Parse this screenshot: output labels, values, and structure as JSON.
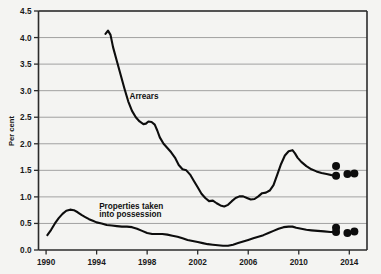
{
  "chart_data": {
    "type": "line",
    "title": "",
    "subtitle": "",
    "xlabel": "",
    "ylabel": "Per cent",
    "xlim": [
      1989.4,
      2015.4
    ],
    "ylim": [
      0.0,
      4.5
    ],
    "grid": true,
    "legend": "inline-annotations",
    "y_ticks": [
      "0.0",
      "0.5",
      "1.0",
      "1.5",
      "2.0",
      "2.5",
      "3.0",
      "3.5",
      "4.0",
      "4.5"
    ],
    "y_tick_values": [
      0.0,
      0.5,
      1.0,
      1.5,
      2.0,
      2.5,
      3.0,
      3.5,
      4.0,
      4.5
    ],
    "x_ticks": [
      "1990",
      "1994",
      "1998",
      "2002",
      "2006",
      "2010",
      "2014"
    ],
    "x_tick_values": [
      1990,
      1994,
      1998,
      2002,
      2006,
      2010,
      2014
    ],
    "annotations": [
      {
        "text": "Arrears",
        "x": 1996.6,
        "y": 2.85
      },
      {
        "text": "Properties taken",
        "x": 1994.2,
        "y": 0.78
      },
      {
        "text": "into possession",
        "x": 1994.2,
        "y": 0.63
      }
    ],
    "series": [
      {
        "name": "Arrears",
        "color": "#0d0d0d",
        "x": [
          1994.7,
          1994.9,
          1995.1,
          1995.3,
          1995.6,
          1995.9,
          1996.2,
          1996.5,
          1996.8,
          1997.1,
          1997.4,
          1997.7,
          1997.9,
          1998.1,
          1998.35,
          1998.6,
          1998.8,
          1999.0,
          1999.3,
          1999.6,
          1999.9,
          2000.2,
          2000.5,
          2000.8,
          2001.1,
          2001.4,
          2001.7,
          2002.0,
          2002.3,
          2002.6,
          2002.9,
          2003.2,
          2003.5,
          2003.8,
          2004.1,
          2004.4,
          2004.7,
          2005.0,
          2005.3,
          2005.6,
          2005.9,
          2006.2,
          2006.5,
          2006.8,
          2007.1,
          2007.4,
          2007.7,
          2008.0,
          2008.3,
          2008.6,
          2008.9,
          2009.2,
          2009.5,
          2009.7,
          2009.9,
          2010.2,
          2010.6,
          2011.0,
          2011.4,
          2011.8,
          2012.2,
          2012.6,
          2012.9
        ],
        "y": [
          4.07,
          4.13,
          4.05,
          3.82,
          3.56,
          3.3,
          3.04,
          2.8,
          2.62,
          2.5,
          2.42,
          2.37,
          2.38,
          2.42,
          2.41,
          2.36,
          2.25,
          2.12,
          2.0,
          1.92,
          1.84,
          1.74,
          1.6,
          1.52,
          1.5,
          1.42,
          1.3,
          1.18,
          1.06,
          0.98,
          0.92,
          0.93,
          0.88,
          0.84,
          0.82,
          0.85,
          0.92,
          0.98,
          1.01,
          1.01,
          0.98,
          0.95,
          0.96,
          1.01,
          1.07,
          1.08,
          1.12,
          1.22,
          1.42,
          1.62,
          1.78,
          1.86,
          1.88,
          1.82,
          1.74,
          1.66,
          1.58,
          1.52,
          1.48,
          1.45,
          1.43,
          1.41,
          1.4
        ]
      },
      {
        "name": "Properties taken into possession",
        "color": "#0d0d0d",
        "x": [
          1990.1,
          1990.4,
          1990.7,
          1991.0,
          1991.3,
          1991.6,
          1991.9,
          1992.2,
          1992.5,
          1992.8,
          1993.1,
          1993.4,
          1993.7,
          1994.0,
          1994.4,
          1994.8,
          1995.2,
          1995.6,
          1996.0,
          1996.4,
          1996.8,
          1997.2,
          1997.6,
          1998.0,
          1998.4,
          1998.8,
          1999.2,
          1999.6,
          2000.0,
          2000.4,
          2000.8,
          2001.2,
          2001.6,
          2002.0,
          2002.4,
          2002.8,
          2003.2,
          2003.6,
          2004.0,
          2004.4,
          2004.8,
          2005.2,
          2005.6,
          2006.0,
          2006.4,
          2006.8,
          2007.2,
          2007.6,
          2008.0,
          2008.4,
          2008.8,
          2009.2,
          2009.5,
          2009.8,
          2010.2,
          2010.6,
          2011.0,
          2011.5,
          2012.0,
          2012.5,
          2012.9
        ],
        "y": [
          0.28,
          0.38,
          0.5,
          0.6,
          0.68,
          0.74,
          0.76,
          0.75,
          0.71,
          0.66,
          0.62,
          0.58,
          0.55,
          0.52,
          0.5,
          0.47,
          0.46,
          0.45,
          0.44,
          0.44,
          0.43,
          0.4,
          0.36,
          0.32,
          0.3,
          0.3,
          0.3,
          0.29,
          0.27,
          0.25,
          0.22,
          0.19,
          0.17,
          0.15,
          0.13,
          0.11,
          0.1,
          0.09,
          0.08,
          0.08,
          0.1,
          0.13,
          0.16,
          0.19,
          0.22,
          0.25,
          0.28,
          0.32,
          0.36,
          0.4,
          0.43,
          0.44,
          0.44,
          0.42,
          0.4,
          0.38,
          0.37,
          0.36,
          0.35,
          0.34,
          0.34
        ]
      }
    ],
    "forecast_points": [
      {
        "series": "Arrears",
        "x": 2012.95,
        "y": 1.58
      },
      {
        "series": "Arrears",
        "x": 2012.95,
        "y": 1.4
      },
      {
        "series": "Arrears",
        "x": 2013.85,
        "y": 1.43
      },
      {
        "series": "Arrears",
        "x": 2014.4,
        "y": 1.44
      },
      {
        "series": "Properties taken into possession",
        "x": 2012.95,
        "y": 0.42
      },
      {
        "series": "Properties taken into possession",
        "x": 2012.95,
        "y": 0.34
      },
      {
        "series": "Properties taken into possession",
        "x": 2013.85,
        "y": 0.32
      },
      {
        "series": "Properties taken into possession",
        "x": 2014.4,
        "y": 0.35
      }
    ]
  }
}
